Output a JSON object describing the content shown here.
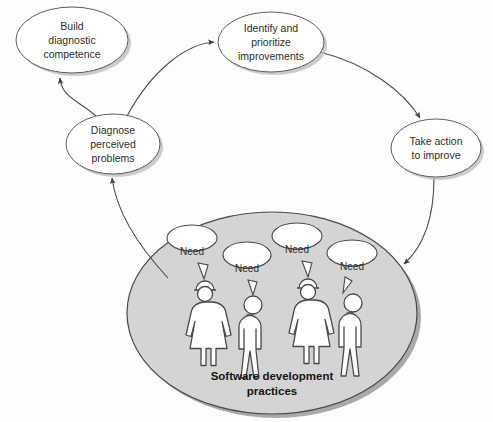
{
  "diagram": {
    "type": "cycle-diagram",
    "colors": {
      "node_fill": "#ffffff",
      "node_stroke": "#5b5b5b",
      "group_fill": "#d4d4d4",
      "group_stroke": "#4a4a4a",
      "arrow": "#4a4a4a",
      "text": "#2b2b2b"
    },
    "nodes": [
      {
        "id": "build-diagnostic-competence",
        "lines": [
          "Build",
          "diagnostic",
          "competence"
        ],
        "cx": 72,
        "cy": 40,
        "rx": 56,
        "ry": 33
      },
      {
        "id": "identify-and-prioritize-improvements",
        "lines": [
          "Identify and",
          "prioritize",
          "improvements"
        ],
        "cx": 271,
        "cy": 42,
        "rx": 53,
        "ry": 30
      },
      {
        "id": "take-action-to-improve",
        "lines": [
          "Take action",
          "to improve"
        ],
        "cx": 436,
        "cy": 148,
        "rx": 45,
        "ry": 29
      },
      {
        "id": "diagnose-perceived-problems",
        "lines": [
          "Diagnose",
          "perceived",
          "problems"
        ],
        "cx": 113,
        "cy": 144,
        "rx": 47,
        "ry": 30
      }
    ],
    "arrows": [
      {
        "id": "arrow-diagnose-to-build",
        "from": "diagnose-perceived-problems",
        "to": "build-diagnostic-competence",
        "path": "M 96,116 C 78,100 60,96 60,76"
      },
      {
        "id": "arrow-diagnose-to-identify",
        "from": "diagnose-perceived-problems",
        "to": "identify-and-prioritize-improvements",
        "path": "M 127,115 C 150,70 185,44 215,42"
      },
      {
        "id": "arrow-identify-to-takeaction",
        "from": "identify-and-prioritize-improvements",
        "to": "take-action-to-improve",
        "path": "M 322,50 C 370,62 405,92 420,117"
      },
      {
        "id": "arrow-takeaction-to-practices",
        "from": "take-action-to-improve",
        "to": "software-development-practices",
        "path": "M 434,178 C 432,215 420,245 400,262"
      },
      {
        "id": "arrow-practices-to-diagnose",
        "from": "software-development-practices",
        "to": "diagnose-perceived-problems",
        "path": "M 166,276 C 140,248 116,215 111,178"
      }
    ],
    "group": {
      "id": "software-development-practices",
      "label_lines": [
        "Software development",
        "practices"
      ],
      "cx": 272,
      "cy": 313,
      "rx": 145,
      "ry": 101,
      "people": [
        {
          "id": "person-1",
          "gender": "female",
          "x": 205,
          "bubble_label": "Need",
          "bubble_x": 192,
          "bubble_y": 265
        },
        {
          "id": "person-2",
          "gender": "male",
          "x": 253,
          "bubble_label": "Need",
          "bubble_x": 245,
          "bubble_y": 281
        },
        {
          "id": "person-3",
          "gender": "female",
          "x": 308,
          "bubble_label": "Need",
          "bubble_x": 297,
          "bubble_y": 262
        },
        {
          "id": "person-4",
          "gender": "male",
          "x": 353,
          "bubble_label": "Need",
          "bubble_x": 348,
          "bubble_y": 279
        }
      ]
    }
  }
}
